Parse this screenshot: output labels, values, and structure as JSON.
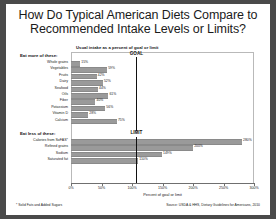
{
  "title": {
    "line1": "How Do Typical American Diets Compare to",
    "line2": "Recommended Intake Levels or Limits?"
  },
  "subtitle": "Usual intake as a percent of goal or limit",
  "groups": {
    "more_label": "Eat more of these:",
    "less_label": "Eat less of these:"
  },
  "reference": {
    "goal_label": "GOAL",
    "limit_label": "LIMIT",
    "value": 100
  },
  "footnote": "* Solid Fats and Added Sugars",
  "source": "Source: USDA & HHS, Dietary Guidelines for Americans, 2010",
  "chart_data": {
    "type": "bar",
    "orientation": "horizontal",
    "title": "How Do Typical American Diets Compare to Recommended Intake Levels or Limits?",
    "subtitle": "Usual intake as a percent of goal or limit",
    "xlabel": "Percent of goal or limit",
    "ylabel": "",
    "xlim": [
      0,
      300
    ],
    "xticks": [
      0,
      50,
      100,
      150,
      200,
      250,
      300
    ],
    "xticklabels": [
      "0%",
      "50%",
      "100%",
      "150%",
      "200%",
      "250%",
      "300%"
    ],
    "grid": false,
    "legend": false,
    "reference_line": {
      "value": 100,
      "labels": [
        "GOAL",
        "LIMIT"
      ]
    },
    "groups": [
      {
        "name": "Eat more of these:",
        "categories": [
          "Whole grains",
          "Vegetables",
          "Fruits",
          "Dairy",
          "Seafood",
          "Oils",
          "Fiber",
          "Potassium",
          "Vitamin D",
          "Calcium"
        ],
        "values": [
          15,
          59,
          42,
          52,
          44,
          61,
          40,
          56,
          28,
          75
        ],
        "labels": [
          "15%",
          "59%",
          "42%",
          "52%",
          "44%",
          "61%",
          "40%",
          "56%",
          "28%",
          "75%"
        ]
      },
      {
        "name": "Eat less of these:",
        "categories": [
          "Calories from SoFAS*",
          "Refined grains",
          "Sodium",
          "Saturated fat"
        ],
        "values": [
          280,
          200,
          149,
          110
        ],
        "labels": [
          "280%",
          "200%",
          "149%",
          "110%"
        ]
      }
    ]
  }
}
